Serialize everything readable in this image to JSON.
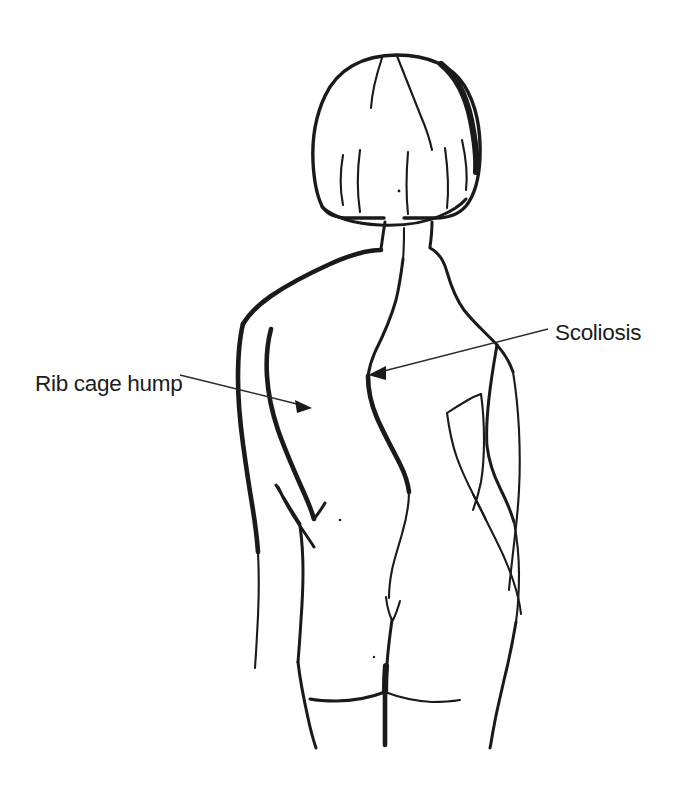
{
  "illustration": {
    "title": "Scoliosis — posterior view of torso",
    "subject": "human-back-female-torso",
    "view": "posterior",
    "background_color": "#ffffff",
    "line_color": "#1a1a1a",
    "leader_color": "#2b2b2b"
  },
  "labels": [
    {
      "id": "rib-cage-hump",
      "text": "Rib cage hump",
      "text_x": 35,
      "text_y": 391,
      "align": "start",
      "leader_from_x": 180,
      "leader_from_y": 375,
      "leader_to_x": 312,
      "leader_to_y": 408,
      "arrow_direction": "right-down",
      "points_at": "left posterior rib prominence"
    },
    {
      "id": "scoliosis",
      "text": "Scoliosis",
      "text_x": 555,
      "text_y": 340,
      "align": "start",
      "leader_from_x": 548,
      "leader_from_y": 330,
      "leader_to_x": 368,
      "leader_to_y": 375,
      "arrow_direction": "left-down",
      "points_at": "lateral curvature of the spine"
    }
  ],
  "anatomy_parts": [
    {
      "name": "hair-bob-outline",
      "interactable": false
    },
    {
      "name": "hair-part-strands",
      "interactable": false
    },
    {
      "name": "hairline-nape",
      "interactable": false
    },
    {
      "name": "neck",
      "interactable": false
    },
    {
      "name": "left-shoulder-contour",
      "interactable": false
    },
    {
      "name": "right-shoulder-contour",
      "interactable": false
    },
    {
      "name": "spine-curve",
      "interactable": false
    },
    {
      "name": "left-arm-outer",
      "interactable": false
    },
    {
      "name": "left-arm-inner",
      "interactable": false
    },
    {
      "name": "left-hand-wedge",
      "interactable": false
    },
    {
      "name": "right-arm-outer",
      "interactable": false
    },
    {
      "name": "right-arm-inner",
      "interactable": false
    },
    {
      "name": "left-torso-flank",
      "interactable": false
    },
    {
      "name": "right-torso-flank",
      "interactable": false
    },
    {
      "name": "gluteal-cleft",
      "interactable": false
    },
    {
      "name": "gluteal-folds",
      "interactable": false
    },
    {
      "name": "left-thigh",
      "interactable": false
    },
    {
      "name": "right-thigh",
      "interactable": false
    },
    {
      "name": "thigh-gap-line",
      "interactable": false
    },
    {
      "name": "sacral-dimple",
      "interactable": false
    }
  ],
  "canvas": {
    "width": 676,
    "height": 788
  }
}
